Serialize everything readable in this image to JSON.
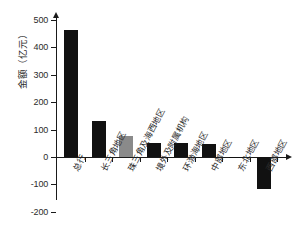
{
  "chart_data": {
    "type": "bar",
    "title": "",
    "xlabel": "",
    "ylabel": "金额（亿元）",
    "ylim": [
      -200,
      500
    ],
    "yticks": [
      500,
      400,
      300,
      200,
      100,
      0,
      -100,
      -200
    ],
    "ytick_labels": [
      "500",
      "400",
      "300",
      "200",
      "100",
      "0",
      "-100",
      "-200"
    ],
    "grid": false,
    "legend": "none",
    "categories": [
      "总行",
      "长三角地区",
      "珠三角及海西地区",
      "境外及附属机构",
      "环渤海地区",
      "中部地区",
      "东北地区",
      "西部地区"
    ],
    "values": [
      465,
      133,
      75,
      51,
      50,
      47,
      -5,
      -118
    ],
    "bar_colors": [
      "#111111",
      "#111111",
      "#8a8a8a",
      "#111111",
      "#111111",
      "#111111",
      "#111111",
      "#111111"
    ]
  },
  "axis": {
    "y_title": "金额（亿元）"
  }
}
